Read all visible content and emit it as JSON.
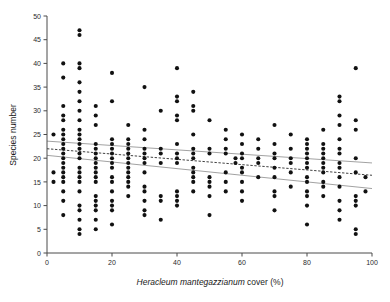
{
  "chart_data": {
    "type": "scatter",
    "title": "",
    "xlabel_italic": "Heracleum mantegazzianum",
    "xlabel_rest": " cover (%)",
    "ylabel": "Species number",
    "xlim": [
      0,
      100
    ],
    "ylim": [
      0,
      50
    ],
    "xticks": [
      0,
      20,
      40,
      60,
      80,
      100
    ],
    "yticks": [
      0,
      5,
      10,
      15,
      20,
      25,
      30,
      35,
      40,
      45,
      50
    ],
    "grid": false,
    "legend": "none",
    "point_color": "#111111",
    "fit_line_color": "#2b2b2b",
    "ci_line_color": "#8a8a8a",
    "regression": {
      "style": "dashed",
      "x_start": 0,
      "y_start": 22.0,
      "x_end": 100,
      "y_end": 16.4
    },
    "confidence_band_upper": {
      "style": "solid",
      "x_start": 0,
      "y_start": 23.6,
      "x_end": 100,
      "y_end": 19.0
    },
    "confidence_band_lower": {
      "style": "solid",
      "x_start": 0,
      "y_start": 20.6,
      "x_end": 100,
      "y_end": 13.6
    },
    "points": [
      [
        2,
        25
      ],
      [
        2,
        17
      ],
      [
        2,
        15
      ],
      [
        5,
        40
      ],
      [
        5,
        37
      ],
      [
        5,
        31
      ],
      [
        5,
        29
      ],
      [
        5,
        28
      ],
      [
        5,
        26
      ],
      [
        5,
        25
      ],
      [
        5,
        24
      ],
      [
        5,
        23
      ],
      [
        5,
        22
      ],
      [
        5,
        21
      ],
      [
        5,
        20
      ],
      [
        5,
        19
      ],
      [
        5,
        18
      ],
      [
        5,
        17
      ],
      [
        5,
        16
      ],
      [
        5,
        15
      ],
      [
        5,
        13
      ],
      [
        5,
        11
      ],
      [
        5,
        8
      ],
      [
        10,
        47
      ],
      [
        10,
        46
      ],
      [
        10,
        40
      ],
      [
        10,
        39
      ],
      [
        10,
        36
      ],
      [
        10,
        34
      ],
      [
        10,
        32
      ],
      [
        10,
        30
      ],
      [
        10,
        28
      ],
      [
        10,
        26
      ],
      [
        10,
        25
      ],
      [
        10,
        24
      ],
      [
        10,
        23
      ],
      [
        10,
        22
      ],
      [
        10,
        21
      ],
      [
        10,
        20
      ],
      [
        10,
        18
      ],
      [
        10,
        17
      ],
      [
        10,
        16
      ],
      [
        10,
        15
      ],
      [
        10,
        13
      ],
      [
        10,
        10
      ],
      [
        10,
        9
      ],
      [
        10,
        7
      ],
      [
        10,
        5
      ],
      [
        10,
        4
      ],
      [
        15,
        31
      ],
      [
        15,
        29
      ],
      [
        15,
        27
      ],
      [
        15,
        23
      ],
      [
        15,
        22
      ],
      [
        15,
        21
      ],
      [
        15,
        20
      ],
      [
        15,
        19
      ],
      [
        15,
        18
      ],
      [
        15,
        17
      ],
      [
        15,
        16
      ],
      [
        15,
        15
      ],
      [
        15,
        12
      ],
      [
        15,
        11
      ],
      [
        15,
        10
      ],
      [
        15,
        9
      ],
      [
        15,
        7
      ],
      [
        15,
        5
      ],
      [
        20,
        38
      ],
      [
        20,
        32
      ],
      [
        20,
        24
      ],
      [
        20,
        23
      ],
      [
        20,
        22
      ],
      [
        20,
        21
      ],
      [
        20,
        20
      ],
      [
        20,
        19
      ],
      [
        20,
        18
      ],
      [
        20,
        16
      ],
      [
        20,
        15
      ],
      [
        20,
        13
      ],
      [
        20,
        11
      ],
      [
        20,
        10
      ],
      [
        20,
        9
      ],
      [
        20,
        6
      ],
      [
        25,
        27
      ],
      [
        25,
        24
      ],
      [
        25,
        23
      ],
      [
        25,
        22
      ],
      [
        25,
        21
      ],
      [
        25,
        20
      ],
      [
        25,
        19
      ],
      [
        25,
        18
      ],
      [
        25,
        17
      ],
      [
        25,
        16
      ],
      [
        25,
        15
      ],
      [
        25,
        14
      ],
      [
        25,
        12
      ],
      [
        30,
        35
      ],
      [
        30,
        26
      ],
      [
        30,
        24
      ],
      [
        30,
        22
      ],
      [
        30,
        21
      ],
      [
        30,
        20
      ],
      [
        30,
        19
      ],
      [
        30,
        17
      ],
      [
        30,
        14
      ],
      [
        30,
        13
      ],
      [
        30,
        11
      ],
      [
        30,
        9
      ],
      [
        30,
        8
      ],
      [
        35,
        30
      ],
      [
        35,
        22
      ],
      [
        35,
        21
      ],
      [
        35,
        19
      ],
      [
        35,
        12
      ],
      [
        35,
        11
      ],
      [
        35,
        7
      ],
      [
        40,
        39
      ],
      [
        40,
        33
      ],
      [
        40,
        32
      ],
      [
        40,
        29
      ],
      [
        40,
        28
      ],
      [
        40,
        23
      ],
      [
        40,
        21
      ],
      [
        40,
        20
      ],
      [
        40,
        19
      ],
      [
        40,
        13
      ],
      [
        40,
        12
      ],
      [
        40,
        11
      ],
      [
        40,
        10
      ],
      [
        45,
        34
      ],
      [
        45,
        31
      ],
      [
        45,
        30
      ],
      [
        45,
        25
      ],
      [
        45,
        22
      ],
      [
        45,
        21
      ],
      [
        45,
        20
      ],
      [
        45,
        18
      ],
      [
        45,
        17
      ],
      [
        45,
        16
      ],
      [
        45,
        15
      ],
      [
        45,
        13
      ],
      [
        50,
        28
      ],
      [
        50,
        22
      ],
      [
        50,
        21
      ],
      [
        50,
        16
      ],
      [
        50,
        15
      ],
      [
        50,
        14
      ],
      [
        50,
        12
      ],
      [
        50,
        8
      ],
      [
        55,
        26
      ],
      [
        55,
        24
      ],
      [
        55,
        22
      ],
      [
        55,
        21
      ],
      [
        55,
        17
      ],
      [
        55,
        15
      ],
      [
        55,
        13
      ],
      [
        58,
        20
      ],
      [
        58,
        19
      ],
      [
        60,
        25
      ],
      [
        60,
        23
      ],
      [
        60,
        21
      ],
      [
        60,
        20
      ],
      [
        60,
        18
      ],
      [
        60,
        17
      ],
      [
        60,
        15
      ],
      [
        60,
        13
      ],
      [
        60,
        11
      ],
      [
        65,
        24
      ],
      [
        65,
        22
      ],
      [
        65,
        20
      ],
      [
        65,
        19
      ],
      [
        65,
        16
      ],
      [
        70,
        27
      ],
      [
        70,
        23
      ],
      [
        70,
        21
      ],
      [
        70,
        20
      ],
      [
        70,
        18
      ],
      [
        70,
        16
      ],
      [
        70,
        13
      ],
      [
        70,
        12
      ],
      [
        70,
        9
      ],
      [
        75,
        25
      ],
      [
        75,
        22
      ],
      [
        75,
        20
      ],
      [
        75,
        19
      ],
      [
        75,
        17
      ],
      [
        75,
        14
      ],
      [
        80,
        24
      ],
      [
        80,
        23
      ],
      [
        80,
        22
      ],
      [
        80,
        21
      ],
      [
        80,
        20
      ],
      [
        80,
        19
      ],
      [
        80,
        18
      ],
      [
        80,
        16
      ],
      [
        80,
        15
      ],
      [
        80,
        13
      ],
      [
        80,
        12
      ],
      [
        80,
        10
      ],
      [
        80,
        6
      ],
      [
        85,
        26
      ],
      [
        85,
        23
      ],
      [
        85,
        22
      ],
      [
        85,
        21
      ],
      [
        85,
        20
      ],
      [
        85,
        19
      ],
      [
        85,
        18
      ],
      [
        85,
        17
      ],
      [
        85,
        15
      ],
      [
        85,
        14
      ],
      [
        85,
        12
      ],
      [
        90,
        33
      ],
      [
        90,
        32
      ],
      [
        90,
        29
      ],
      [
        90,
        27
      ],
      [
        90,
        24
      ],
      [
        90,
        22
      ],
      [
        90,
        21
      ],
      [
        90,
        19
      ],
      [
        90,
        18
      ],
      [
        90,
        16
      ],
      [
        90,
        14
      ],
      [
        90,
        11
      ],
      [
        90,
        9
      ],
      [
        90,
        7
      ],
      [
        95,
        39
      ],
      [
        95,
        28
      ],
      [
        95,
        26
      ],
      [
        95,
        20
      ],
      [
        95,
        17
      ],
      [
        95,
        12
      ],
      [
        95,
        11
      ],
      [
        95,
        10
      ],
      [
        95,
        5
      ],
      [
        95,
        4
      ],
      [
        98,
        16
      ],
      [
        98,
        13
      ]
    ]
  }
}
